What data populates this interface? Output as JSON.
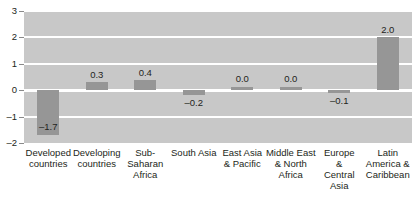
{
  "chart_data": {
    "type": "bar",
    "title": "",
    "subtitle": "",
    "xlabel": "",
    "ylabel": "",
    "ylim": [
      -2,
      3
    ],
    "yticks": [
      3,
      2,
      1,
      0,
      -1,
      -2
    ],
    "ytick_labels": [
      "3",
      "2",
      "1",
      "0",
      "–1",
      "–2"
    ],
    "grid": true,
    "legend": "none",
    "categories": [
      "Developed countries",
      "Developing countries",
      "Sub-Saharan Africa",
      "South Asia",
      "East Asia & Pacific",
      "Middle East & North Africa",
      "Europe & Central Asia",
      "Latin America & Caribbean"
    ],
    "category_lines": [
      [
        "Developed",
        "countries"
      ],
      [
        "Developing",
        "countries"
      ],
      [
        "Sub-",
        "Saharan",
        "Africa"
      ],
      [
        "South Asia"
      ],
      [
        "East Asia",
        "& Pacific"
      ],
      [
        "Middle East",
        "& North",
        "Africa"
      ],
      [
        "Europe",
        "&",
        "Central",
        "Asia"
      ],
      [
        "Latin",
        "America &",
        "Caribbean"
      ]
    ],
    "values": [
      -1.7,
      0.3,
      0.4,
      -0.2,
      0.0,
      0.0,
      -0.1,
      2.0
    ],
    "value_labels": [
      "–1.7",
      "0.3",
      "0.4",
      "–0.2",
      "0.0",
      "0.0",
      "–0.1",
      "2.0"
    ],
    "colors": {
      "bar": "#969696",
      "plot_background": "#c8c8c8",
      "gridline": "#ffffff",
      "text": "#231f20",
      "page_background": "#ffffff"
    }
  }
}
